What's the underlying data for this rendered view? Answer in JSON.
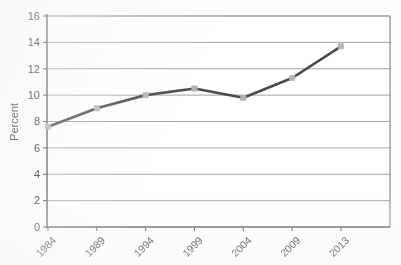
{
  "chart_data": {
    "type": "line",
    "title": "",
    "subtitle": "",
    "xlabel": "",
    "ylabel": "Percent",
    "categories": [
      "1984",
      "1989",
      "1994",
      "1999",
      "2004",
      "2009",
      "2013"
    ],
    "values": [
      7.6,
      9.0,
      10.0,
      10.5,
      9.8,
      11.3,
      13.7
    ],
    "series": [
      {
        "name": "Percent",
        "values": [
          7.6,
          9.0,
          10.0,
          10.5,
          9.8,
          11.3,
          13.7
        ]
      }
    ],
    "ylim": [
      0,
      16
    ],
    "y_ticks": [
      0,
      2,
      4,
      6,
      8,
      10,
      12,
      14,
      16
    ],
    "y_tick_labels": [
      "0",
      "2",
      "4",
      "6",
      "8",
      "10",
      "12",
      "14",
      "16"
    ],
    "x_tick_labels": [
      "1984",
      "1989",
      "1994",
      "1999",
      "2004",
      "2009",
      "2013"
    ],
    "x_tick_label_rotation": -45,
    "grid": "horizontal",
    "legend": "none",
    "line_color": "#4a4a4a",
    "marker_color": "#b4b4b4",
    "marker_shape": "square",
    "axis_color": "#5a5a5a",
    "gridline_color": "#8a8a8a",
    "background_color": "#ffffff",
    "annotations": []
  },
  "axis": {
    "y_title": "Percent"
  }
}
